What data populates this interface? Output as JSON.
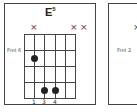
{
  "diagrams": [
    {
      "title": "E",
      "title_superscript": "5",
      "fret_label": "Fret 6",
      "muted_strings": [
        1,
        5,
        6
      ],
      "mute_symbol": "×",
      "dots": [
        {
          "string": 2,
          "fret": 1
        },
        {
          "string": 3,
          "fret": 4
        },
        {
          "string": 4,
          "fret": 4
        }
      ],
      "fingers": [
        "1",
        "3",
        "4"
      ]
    },
    {
      "fret_label": "Fret 2",
      "mute_symbol": "×"
    }
  ],
  "colors": {
    "line": "#444444",
    "dot": "#222222",
    "background": "#ffffff"
  }
}
